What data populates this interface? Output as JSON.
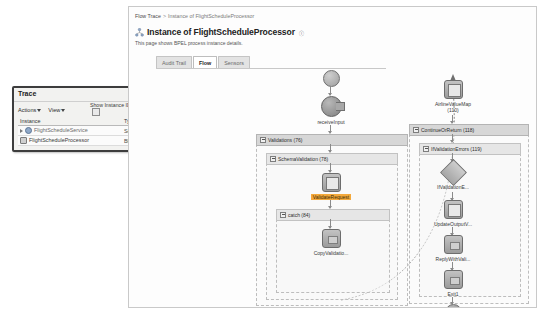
{
  "breadcrumb": {
    "root": "Flow Trace",
    "separator": ">",
    "current": "Instance of FlightScheduleProcessor"
  },
  "header": {
    "title": "Instance of FlightScheduleProcessor",
    "info_marker": "ⓘ",
    "description": "This page shows BPEL process instance details."
  },
  "tabs": [
    {
      "label": "Audit Trail",
      "active": false
    },
    {
      "label": "Flow",
      "active": true
    },
    {
      "label": "Sensors",
      "active": false
    }
  ],
  "trace_panel": {
    "title": "Trace",
    "actions_label": "Actions",
    "view_label": "View",
    "show_instance_ids_label": "Show Instance IDs",
    "show_instance_ids_checked": false,
    "columns": [
      "Instance",
      "Type",
      "Usage",
      "State"
    ],
    "rows": [
      {
        "instance": "FlightScheduleService",
        "type": "Service",
        "usage": "Service",
        "state": "Completed",
        "state_icon": "check-icon",
        "instance_icon": "service-icon",
        "indent": 0
      },
      {
        "instance": "FlightScheduleProcessor",
        "type": "BPEL",
        "usage": "",
        "state": "Aborted",
        "state_icon": "aborted-icon",
        "instance_icon": "bpel-icon",
        "indent": 1
      }
    ]
  },
  "flow": {
    "start_node": "start-node",
    "nodes": {
      "receive_input": "receiveInput",
      "validations_scope": "Validations (76)",
      "schema_validation_scope": "SchemaValidation (78)",
      "validate_request": "ValidateRequest",
      "catch_scope": "catch (84)",
      "copy_validation": "CopyValidatio...",
      "airline_value_map": "AirlineValueMap",
      "airline_value_map_id": "(110)",
      "continue_or_return_scope": "ContinueOrReturn (118)",
      "if_validation_errors_scope": "IfValidationErrors (119)",
      "if_validation_e": "IfValidationE...",
      "update_output": "UpdateOutputV...",
      "reply_with_vali": "ReplyWithVali...",
      "exit1": "Exit1"
    }
  },
  "colors": {
    "highlight": "#f4a93c",
    "scope_bar": "#d7d7d7",
    "node_border": "#6d6d6d",
    "completed": "#2f7d32"
  }
}
